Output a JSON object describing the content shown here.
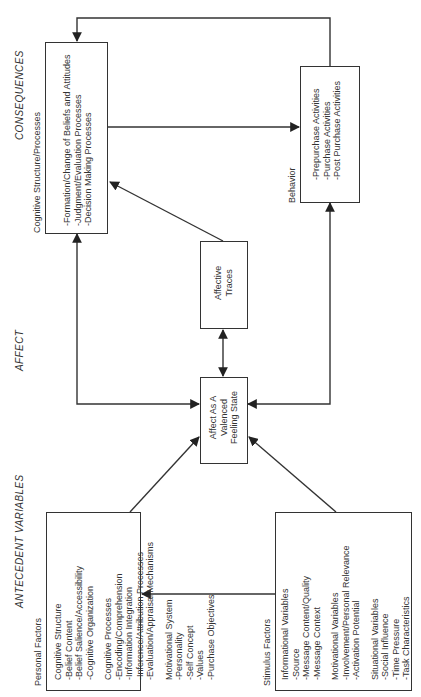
{
  "sections": {
    "consequences": "CONSEQUENCES",
    "affect": "AFFECT",
    "antecedent": "ANTECEDENT VARIABLES"
  },
  "cognitive": {
    "title": "Cognitive Structure/Processes",
    "items": [
      "-Formation/Change of Beliefs and Attitudes",
      "-Judgment/Evaluation Processes",
      "-Decision Making Processes"
    ]
  },
  "behavior": {
    "title": "Behavior",
    "items": [
      "-Prepurchase Activities",
      "-Purchase Activities",
      "-Post Purchase Activities"
    ]
  },
  "affective_traces": {
    "lines": [
      "Affective",
      "Traces"
    ]
  },
  "affect_state": {
    "lines": [
      "Affect As A",
      "Valenced",
      "Feeling State"
    ]
  },
  "personal": {
    "title": "Personal Factors",
    "groups": [
      {
        "heading": "Cognitive Structure",
        "items": [
          "-Belief Content",
          "-Belief Salience/Accessibility",
          "-Cognitive Organization"
        ]
      },
      {
        "heading": "Cognitive Processes",
        "items": [
          "-Encoding/Comprehension",
          "-Information Integration",
          "-Inference/Attribution Processes",
          "-Evaluation/Appraisal Mechanisms"
        ]
      },
      {
        "heading": "Motivational System",
        "items": [
          "-Personality",
          "-Self Concept",
          "-Values",
          "-Purchase Objectives"
        ]
      }
    ]
  },
  "stimulus": {
    "title": "Stimulus Factors",
    "groups": [
      {
        "heading": "Informational Variables",
        "items": [
          "-Source",
          "-Message Content/Quality",
          "-Message Context"
        ]
      },
      {
        "heading": "Motivational Variables",
        "items": [
          "-Involvement/Personal Relevance",
          "-Activation Potential"
        ]
      },
      {
        "heading": "Situational Variables",
        "items": [
          "-Social Influence",
          "-Time Pressure",
          "-Task Characteristics"
        ]
      }
    ]
  }
}
